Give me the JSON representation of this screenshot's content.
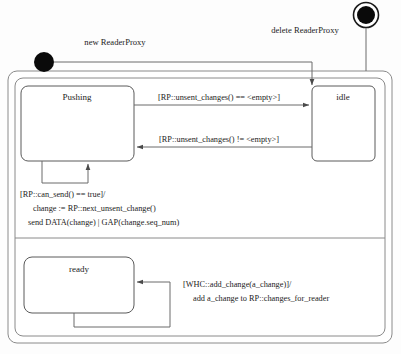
{
  "diagram": {
    "background_color": "#fdfdfd",
    "line_color": "#6b6b6b",
    "text_color": "#1c1c1c"
  },
  "entry_points": {
    "initial_label": "new ReaderProxy",
    "final_label": "delete ReaderProxy"
  },
  "states": {
    "pushing": "Pushing",
    "idle": "idle",
    "ready": "ready"
  },
  "transitions": {
    "pushing_to_idle": "[RP::unsent_changes() == <empty>]",
    "idle_to_pushing": "[RP::unsent_changes() != <empty>]",
    "pushing_self_line1": "[RP::can_send() == true]/",
    "pushing_self_line2": "change := RP::next_unsent_change()",
    "pushing_self_line3": "send DATA(change) | GAP(change.seq_num)",
    "ready_self_line1": "[WHC::add_change(a_change)]/",
    "ready_self_line2": "add a_change to RP::changes_for_reader"
  }
}
